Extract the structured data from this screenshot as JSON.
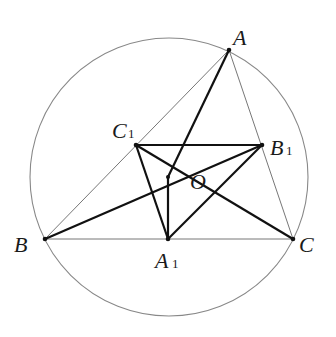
{
  "figure": {
    "circle": {
      "cx": 169,
      "cy": 177,
      "r": 139
    },
    "points": {
      "A": {
        "x": 229,
        "y": 50
      },
      "B": {
        "x": 45,
        "y": 239
      },
      "C": {
        "x": 293,
        "y": 239
      },
      "A1": {
        "x": 168,
        "y": 239
      },
      "B1": {
        "x": 262,
        "y": 145
      },
      "C1": {
        "x": 136,
        "y": 145
      },
      "O": {
        "x": 168,
        "y": 177
      }
    },
    "labels": {
      "A": {
        "main": "A",
        "sub": ""
      },
      "B": {
        "main": "B",
        "sub": ""
      },
      "C": {
        "main": "C",
        "sub": ""
      },
      "A1": {
        "main": "A",
        "sub": "1"
      },
      "B1": {
        "main": "B",
        "sub": "1"
      },
      "C1": {
        "main": "C",
        "sub": "1"
      },
      "O": {
        "main": "O",
        "sub": ""
      }
    },
    "thin_segments": [
      "AB",
      "AC",
      "BC"
    ],
    "thick_segments": [
      "AO",
      "BO",
      "OB1",
      "CO",
      "OC1",
      "OA1",
      "C1B1",
      "C1A1",
      "A1B1"
    ],
    "colors": {
      "thin": "#777777",
      "thick": "#111111",
      "circle": "#888888"
    }
  }
}
